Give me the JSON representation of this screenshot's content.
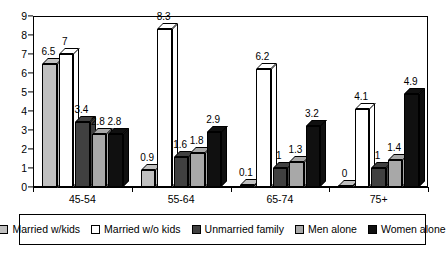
{
  "chart_data": {
    "type": "bar",
    "title": "",
    "subtitle": "",
    "xlabel": "",
    "ylabel": "",
    "categories": [
      "45-54",
      "55-64",
      "65-74",
      "75+"
    ],
    "ylim": [
      0,
      9
    ],
    "y_ticks": [
      "0",
      "1",
      "2",
      "3",
      "4",
      "5",
      "6",
      "7",
      "8",
      "9"
    ],
    "grid": false,
    "legend_position": "bottom",
    "style": "3d-clustered-column",
    "series": [
      {
        "name": "Married w/kids",
        "color": "#c0c0c0",
        "values": [
          6.5,
          0.9,
          0.1,
          0
        ],
        "labels": [
          "6.5",
          "0.9",
          "0.1",
          "0"
        ]
      },
      {
        "name": "Married w/o kids",
        "color": "#ffffff",
        "values": [
          7,
          8.3,
          6.2,
          4.1
        ],
        "labels": [
          "7",
          "8.3",
          "6.2",
          "4.1"
        ]
      },
      {
        "name": "Unmarried family",
        "color": "#404040",
        "values": [
          3.4,
          1.6,
          1,
          1
        ],
        "labels": [
          "3.4",
          "1.6",
          "1",
          "1"
        ]
      },
      {
        "name": "Men alone",
        "color": "#a8a8a8",
        "values": [
          2.8,
          1.8,
          1.3,
          1.4
        ],
        "labels": [
          "2.8",
          "1.8",
          "1.3",
          "1.4"
        ]
      },
      {
        "name": "Women alone",
        "color": "#101010",
        "values": [
          2.8,
          2.9,
          3.2,
          4.9
        ],
        "labels": [
          "2.8",
          "2.9",
          "3.2",
          "4.9"
        ]
      }
    ]
  }
}
